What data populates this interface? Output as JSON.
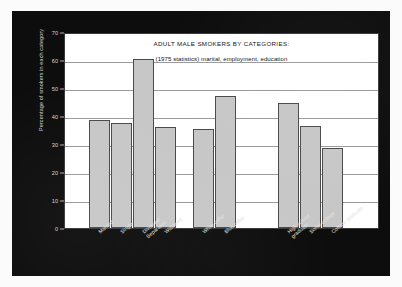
{
  "chart_data": {
    "type": "bar",
    "title": "ADULT MALE SMOKERS BY CATEGORIES:",
    "subtitle": "(1975 statistics) marital, employment, education",
    "xlabel": "",
    "ylabel": "Percentage of smokers in each category",
    "ylim": [
      0,
      70
    ],
    "ytick_step": 10,
    "yticks": [
      0,
      10,
      20,
      30,
      40,
      50,
      60,
      70
    ],
    "grid": true,
    "legend": "none",
    "bar_color": "#c7c7c7",
    "bar_edge_color": "#4a4a4a",
    "panel_background": "#ffffff",
    "figure_background": "#0d0d0d",
    "categories": [
      "Married",
      "Single",
      "Divorced/ Separated",
      "Widowed",
      "White collar",
      "Blue collar",
      "High school graduate",
      "Some college",
      "College graduate"
    ],
    "values": [
      38.5,
      37.5,
      60.5,
      36,
      35.5,
      47,
      44.5,
      36.5,
      28.5
    ],
    "groups": [
      {
        "name": "marital",
        "categories": [
          "Married",
          "Single",
          "Divorced/ Separated",
          "Widowed"
        ]
      },
      {
        "name": "employment",
        "categories": [
          "White collar",
          "Blue collar"
        ]
      },
      {
        "name": "education",
        "categories": [
          "High school graduate",
          "Some college",
          "College graduate"
        ]
      }
    ],
    "bars": [
      {
        "label": "Married",
        "label_lines": [
          "Married"
        ],
        "value": 38.5,
        "x": 24,
        "width": 21
      },
      {
        "label": "Single",
        "label_lines": [
          "Single"
        ],
        "value": 37.5,
        "x": 46,
        "width": 21
      },
      {
        "label": "Divorced/ Separated",
        "label_lines": [
          "Divorced/",
          "Separated"
        ],
        "value": 60.5,
        "x": 68,
        "width": 21
      },
      {
        "label": "Widowed",
        "label_lines": [
          "Widowed"
        ],
        "value": 36,
        "x": 90,
        "width": 21
      },
      {
        "label": "White collar",
        "label_lines": [
          "White collar"
        ],
        "value": 35.5,
        "x": 128,
        "width": 21
      },
      {
        "label": "Blue collar",
        "label_lines": [
          "Blue collar"
        ],
        "value": 47,
        "x": 150,
        "width": 21
      },
      {
        "label": "High school graduate",
        "label_lines": [
          "High school",
          "graduate"
        ],
        "value": 44.5,
        "x": 213,
        "width": 21
      },
      {
        "label": "Some college",
        "label_lines": [
          "Some college"
        ],
        "value": 36.5,
        "x": 235,
        "width": 21
      },
      {
        "label": "College graduate",
        "label_lines": [
          "College graduate"
        ],
        "value": 28.5,
        "x": 257,
        "width": 21
      }
    ]
  }
}
